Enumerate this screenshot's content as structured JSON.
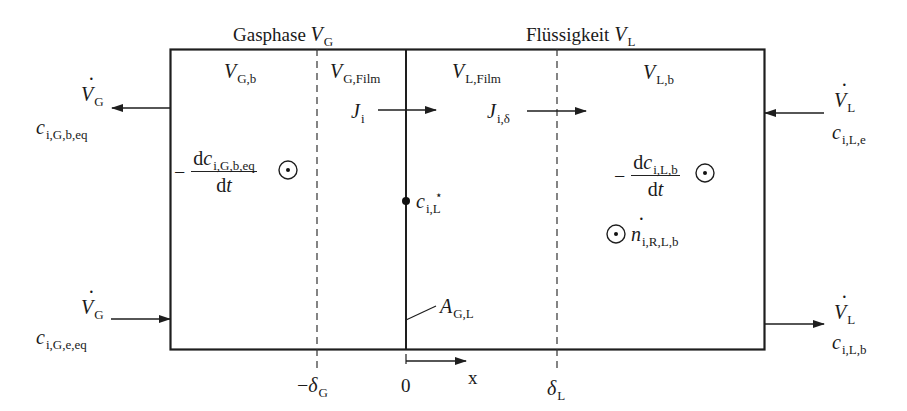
{
  "titles": {
    "gas_phase": {
      "text": "Gasphase",
      "symbol": "V",
      "sub": "G"
    },
    "liquid_phase": {
      "text": "Flüssigkeit",
      "symbol": "V",
      "sub": "L"
    }
  },
  "regions": {
    "gas_bulk": {
      "symbol": "V",
      "sub": "G,b"
    },
    "gas_film": {
      "symbol": "V",
      "sub": "G,Film"
    },
    "liquid_film": {
      "symbol": "V",
      "sub": "L,Film"
    },
    "liquid_bulk": {
      "symbol": "V",
      "sub": "L,b"
    }
  },
  "fluxes": {
    "interface_flux": {
      "symbol": "J",
      "sub": "i"
    },
    "film_flux": {
      "symbol": "J",
      "sub": "i,δ"
    }
  },
  "streams": {
    "gas_out": {
      "flow_symbol": "V",
      "flow_sub": "G",
      "conc_symbol": "c",
      "conc_sub": "i,G,b,eq",
      "direction": "out-left"
    },
    "gas_in": {
      "flow_symbol": "V",
      "flow_sub": "G",
      "conc_symbol": "c",
      "conc_sub": "i,G,e,eq",
      "direction": "in-right"
    },
    "liquid_in": {
      "flow_symbol": "V",
      "flow_sub": "L",
      "conc_symbol": "c",
      "conc_sub": "i,L,e",
      "direction": "in-left"
    },
    "liquid_out": {
      "flow_symbol": "V",
      "flow_sub": "L",
      "conc_symbol": "c",
      "conc_sub": "i,L,b",
      "direction": "out-right"
    }
  },
  "accumulation": {
    "gas": {
      "minus": "−",
      "numerator_d": "d",
      "numerator_symbol": "c",
      "numerator_sub": "i,G,b,eq",
      "denominator": "dt",
      "den_d": "d",
      "den_t": "t"
    },
    "liquid": {
      "minus": "−",
      "numerator_d": "d",
      "numerator_symbol": "c",
      "numerator_sub": "i,L,b",
      "denominator": "dt",
      "den_d": "d",
      "den_t": "t"
    }
  },
  "reaction": {
    "symbol": "n",
    "sub": "i,R,L,b"
  },
  "interface": {
    "concentration": {
      "symbol": "c",
      "sup": "⋆",
      "sub": "i,L"
    },
    "area": {
      "symbol": "A",
      "sub": "G,L"
    }
  },
  "axis": {
    "ticks": [
      {
        "label_prefix": "−",
        "symbol": "δ",
        "sub": "G"
      },
      {
        "label": "0"
      },
      {
        "symbol": "δ",
        "sub": "L"
      }
    ],
    "axis_label": "x"
  },
  "colors": {
    "line": "#1e1e1e",
    "text": "#1a1a1a",
    "background": "#ffffff"
  }
}
